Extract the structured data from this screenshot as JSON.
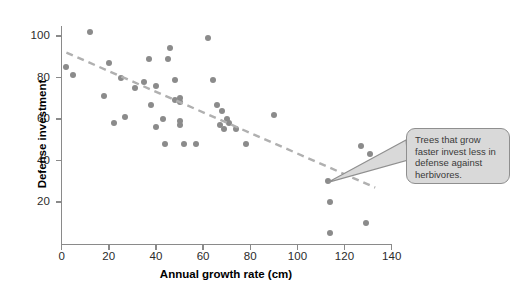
{
  "figure": {
    "background_color": "#ffffff",
    "point_color": "#8b8b8b",
    "axis_color": "#8a8a8a",
    "trendline_color": "#b0b0b0",
    "callout_fill": "#d9d9d9",
    "callout_border": "#8f8f8f"
  },
  "callout": {
    "text": "Trees that grow faster invest less in defense against herbivores."
  },
  "chart_data": {
    "type": "scatter",
    "title": "",
    "xlabel": "Annual growth rate (cm)",
    "ylabel": "Defense investment",
    "xlim": [
      0,
      140
    ],
    "ylim": [
      0,
      110
    ],
    "xticks": [
      0,
      20,
      40,
      60,
      80,
      100,
      120,
      140
    ],
    "yticks": [
      20,
      40,
      60,
      80,
      100
    ],
    "xtick_labels": [
      "0",
      "20",
      "40",
      "60",
      "80",
      "100",
      "120",
      "140"
    ],
    "ytick_labels": [
      "20",
      "40",
      "60",
      "80",
      "100"
    ],
    "grid": false,
    "legend": false,
    "points": [
      [
        12,
        102
      ],
      [
        2,
        85
      ],
      [
        5,
        81
      ],
      [
        20,
        87
      ],
      [
        18,
        71
      ],
      [
        25,
        80
      ],
      [
        22,
        58
      ],
      [
        27,
        61
      ],
      [
        31,
        75
      ],
      [
        37,
        89
      ],
      [
        35,
        78
      ],
      [
        38,
        67
      ],
      [
        40,
        76
      ],
      [
        40,
        56
      ],
      [
        43,
        60
      ],
      [
        44,
        48
      ],
      [
        46,
        94
      ],
      [
        45,
        89
      ],
      [
        48,
        79
      ],
      [
        48,
        69
      ],
      [
        50,
        68
      ],
      [
        50,
        70
      ],
      [
        50,
        59
      ],
      [
        50,
        57
      ],
      [
        52,
        48
      ],
      [
        57,
        48
      ],
      [
        62,
        99
      ],
      [
        64,
        79
      ],
      [
        66,
        67
      ],
      [
        68,
        64
      ],
      [
        67,
        57
      ],
      [
        69,
        55
      ],
      [
        70,
        60
      ],
      [
        71,
        58
      ],
      [
        74,
        55
      ],
      [
        78,
        48
      ],
      [
        90,
        62
      ],
      [
        113,
        30
      ],
      [
        114,
        20
      ],
      [
        114,
        5
      ],
      [
        127,
        47
      ],
      [
        131,
        43
      ],
      [
        129,
        10
      ]
    ],
    "trendline": {
      "style": "dashed",
      "x_start": 2,
      "y_start": 92,
      "x_end": 133,
      "y_end": 27
    },
    "annotation": {
      "text": "Trees that grow faster invest less in defense against herbivores.",
      "points_to_x": 113,
      "points_to_y": 30
    }
  }
}
